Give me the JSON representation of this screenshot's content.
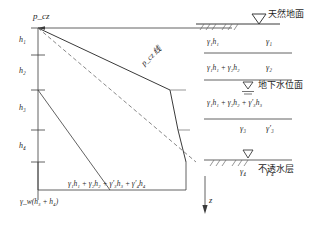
{
  "figure": {
    "type": "geotechnical-stress-diagram",
    "top_stress_label": "p_cz",
    "depth_axis_label": "z",
    "slope_line_label": "p_cz 线",
    "bottom_water_pressure": "γ_w(h₃ + h₄)",
    "bottom_total_stress": "γ₁h₁ + γ₂h₂ + γ′₃h₃ + γ′₄h₄"
  },
  "depth_labels": [
    {
      "id": "h1",
      "text": "h₁"
    },
    {
      "id": "h2",
      "text": "h₂"
    },
    {
      "id": "h3",
      "text": "h₃"
    },
    {
      "id": "h4",
      "text": "h₄"
    }
  ],
  "stress_values": [
    {
      "id": "sigma1",
      "text": "γ₁h₁"
    },
    {
      "id": "sigma2",
      "text": "γ₁h₁ + γ₂h₂"
    },
    {
      "id": "sigma3",
      "text": "γ₁h₁ + γ₂h₂ + γ′₃h₃"
    }
  ],
  "unit_weights": [
    {
      "id": "layer1",
      "natural": "γ₁",
      "effective": ""
    },
    {
      "id": "layer2",
      "natural": "γ₂",
      "effective": ""
    },
    {
      "id": "layer3",
      "natural": "γ₃",
      "effective": "γ′₃"
    },
    {
      "id": "layer4",
      "natural": "γ₄",
      "effective": "γ′₄"
    }
  ],
  "annotations": {
    "ground_surface": "天然地面",
    "water_table": "地下水位面",
    "impervious_layer": "不透水层"
  },
  "colors": {
    "line": "#3a3a3a",
    "text": "#1f1f1f",
    "background": "#ffffff"
  }
}
